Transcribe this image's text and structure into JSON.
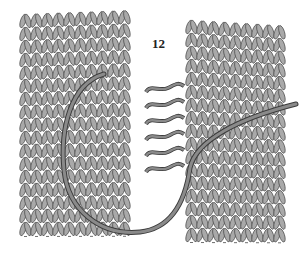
{
  "figure": {
    "label": "12",
    "colors": {
      "background": "#ffffff",
      "stitch_fill": "#a9a9a9",
      "stitch_stroke": "#4a4a4a",
      "yarn": "#8a8a8a",
      "yarn_stroke": "#3c3c3c"
    },
    "panels": [
      {
        "name": "left-knitted-panel",
        "x": 20,
        "y": 14,
        "width": 120,
        "height": 232,
        "top_skew": -4
      },
      {
        "name": "right-knitted-panel",
        "x": 186,
        "y": 20,
        "width": 100,
        "height": 226,
        "top_skew": 6
      }
    ],
    "seam_bars": 6
  }
}
